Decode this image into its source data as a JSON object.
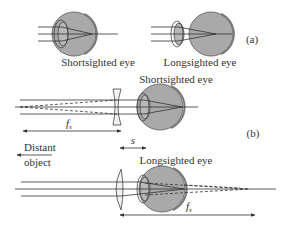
{
  "figure": {
    "part_a": {
      "tag": "(a)",
      "shortsighted": {
        "label": "Shortsighted eye"
      },
      "longsighted": {
        "label": "Longsighted eye"
      }
    },
    "part_b": {
      "tag": "(b)",
      "shortsighted": {
        "label": "Shortsighted eye",
        "lens": "concave",
        "focal_label": "f",
        "focal_sub": "s"
      },
      "spacing_label": "s",
      "distant_object": {
        "line1": "Distant",
        "line2": "object"
      },
      "longsighted": {
        "label": "Longsighted eye",
        "lens": "convex",
        "focal_label": "f",
        "focal_sub": "s"
      }
    },
    "colors": {
      "eye_fill": "#a9a9a9",
      "eye_stroke": "#6e6e6e",
      "line": "#3a3a3a",
      "text": "#333333"
    }
  }
}
